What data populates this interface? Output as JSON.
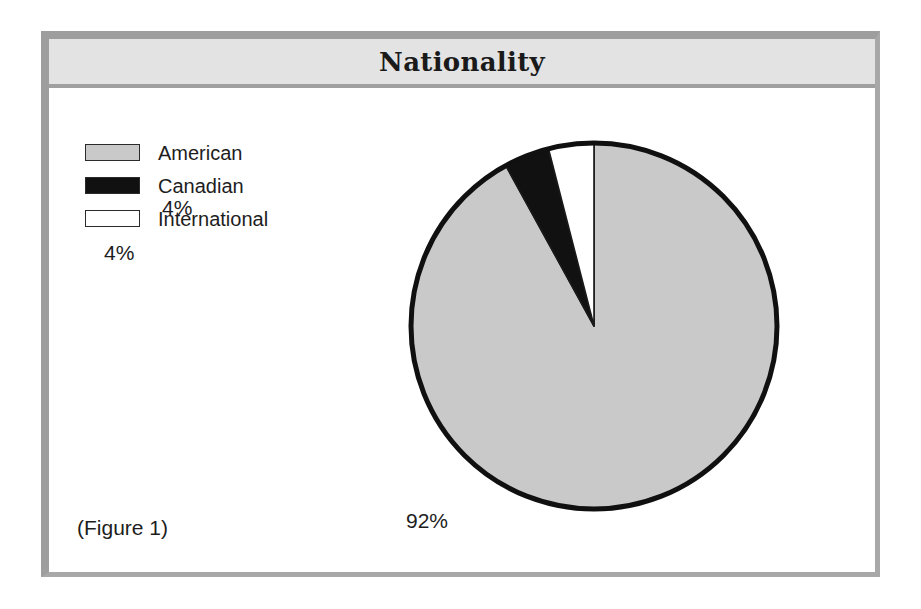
{
  "figure": {
    "title": "Nationality",
    "caption": "(Figure 1)"
  },
  "legend": {
    "items": [
      {
        "label": "American",
        "color": "#c9c9c9",
        "swatch": "legend-swatch-american"
      },
      {
        "label": "Canadian",
        "color": "#111111",
        "swatch": "legend-swatch-canadian"
      },
      {
        "label": "International",
        "color": "#ffffff",
        "swatch": "legend-swatch-international"
      }
    ]
  },
  "labels": {
    "american": "92%",
    "canadian": "4%",
    "international": "4%"
  },
  "colors": {
    "frame_border": "#9e9e9e",
    "title_bar": "#e3e3e3",
    "pie_outline": "#101010",
    "american": "#c9c9c9",
    "canadian": "#111111",
    "international": "#ffffff",
    "text": "#1d1d1d",
    "page_background": "#ffffff"
  },
  "chart_data": {
    "type": "pie",
    "title": "Nationality",
    "categories": [
      "American",
      "Canadian",
      "International"
    ],
    "values": [
      92,
      4,
      4
    ],
    "unit": "percent",
    "data_labels": [
      "92%",
      "4%",
      "4%"
    ],
    "slice_colors": [
      "#c9c9c9",
      "#111111",
      "#ffffff"
    ],
    "legend": [
      "American",
      "Canadian",
      "International"
    ],
    "legend_position": "top-left",
    "start_angle_deg": 0,
    "direction": "counterclockwise",
    "grid": false,
    "xlabel": "",
    "ylabel": ""
  }
}
